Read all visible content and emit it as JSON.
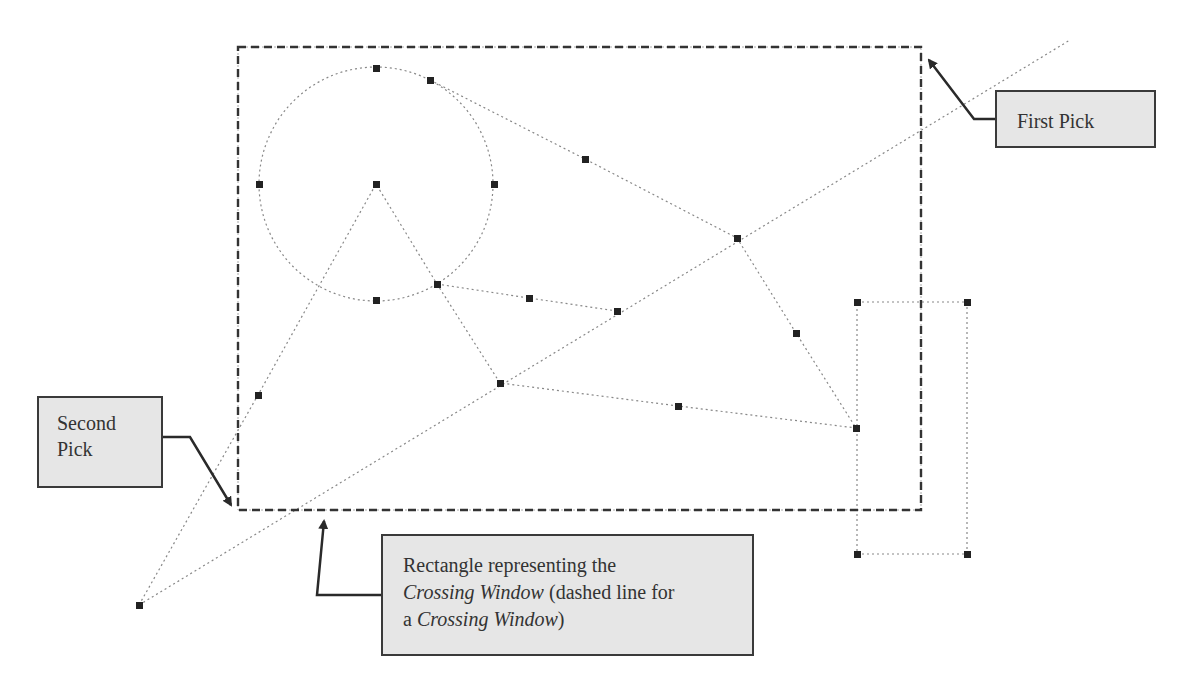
{
  "labels": {
    "first_pick": "First Pick",
    "second_pick_line1": "Second",
    "second_pick_line2": "Pick",
    "crossing_note": {
      "line1": "Rectangle representing the",
      "line2_italic": "Crossing Window",
      "line2_rest": " (dashed line for",
      "line3_start": "a ",
      "line3_italic": "Crossing Window",
      "line3_end": ")"
    }
  },
  "colors": {
    "callout_fill": "#e6e6e6",
    "callout_border": "#3a3a3a",
    "geometry_line": "#888888",
    "grip": "#222222",
    "crossing_window": "#333333"
  },
  "crossing_window": {
    "first_pick": [
      921,
      47
    ],
    "second_pick": [
      238,
      510
    ]
  },
  "circle": {
    "center": [
      376,
      184
    ],
    "radius": 117
  },
  "grips": [
    [
      376,
      68
    ],
    [
      430,
      80
    ],
    [
      259,
      184
    ],
    [
      376,
      184
    ],
    [
      494,
      184
    ],
    [
      376,
      300
    ],
    [
      437,
      284
    ],
    [
      529,
      298
    ],
    [
      617,
      311
    ],
    [
      585,
      159
    ],
    [
      737,
      238
    ],
    [
      796,
      333
    ],
    [
      500,
      383
    ],
    [
      678,
      406
    ],
    [
      856,
      428
    ],
    [
      258,
      395
    ],
    [
      139,
      605
    ],
    [
      857,
      302
    ],
    [
      967,
      302
    ],
    [
      857,
      554
    ],
    [
      967,
      554
    ]
  ]
}
